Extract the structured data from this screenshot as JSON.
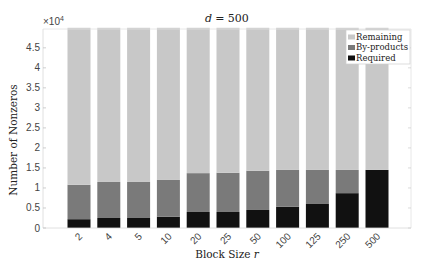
{
  "chart_data": {
    "type": "bar",
    "stacked": true,
    "title_var": "d",
    "title_value": "= 500",
    "xlabel": "Block Size r",
    "xlabel_text": "Block Size ",
    "xlabel_var": "r",
    "ylabel": "Number of Nonzeros",
    "y_multiplier": "×10",
    "y_multiplier_exp": "4",
    "ylim": [
      0,
      4.97
    ],
    "yticks": [
      0,
      0.5,
      1,
      1.5,
      2,
      2.5,
      3,
      3.5,
      4,
      4.5
    ],
    "ytick_labels": [
      "0",
      "0.5",
      "1",
      "1.5",
      "2",
      "2.5",
      "3",
      "3.5",
      "4",
      "4.5"
    ],
    "categories": [
      "2",
      "4",
      "5",
      "10",
      "20",
      "25",
      "50",
      "100",
      "125",
      "250",
      "500"
    ],
    "series": [
      {
        "name": "Required",
        "color": "#111111",
        "values": [
          0.22,
          0.25,
          0.25,
          0.28,
          0.4,
          0.4,
          0.45,
          0.53,
          0.6,
          0.87,
          1.45
        ]
      },
      {
        "name": "By-products",
        "color": "#7a7a7a",
        "values": [
          0.86,
          0.9,
          0.9,
          0.92,
          0.97,
          0.98,
          0.98,
          0.92,
          0.85,
          0.58,
          0.0
        ]
      },
      {
        "name": "Remaining",
        "color": "#c8c8c8",
        "values": [
          3.92,
          3.85,
          3.85,
          3.8,
          3.63,
          3.62,
          3.57,
          3.55,
          3.55,
          3.55,
          3.55
        ]
      }
    ],
    "legend": {
      "position": "upper right",
      "entries": [
        "Remaining",
        "By-products",
        "Required"
      ]
    },
    "grid": false,
    "units_note": "values in units of 10^4"
  }
}
